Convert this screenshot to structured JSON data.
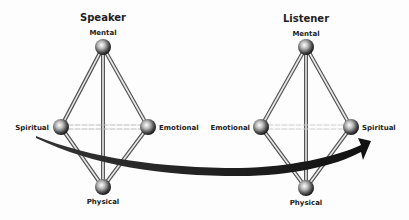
{
  "diagrams": [
    {
      "title": "Speaker",
      "nodes": {
        "top": "Mental",
        "left": "Spiritual",
        "right": "Emotional",
        "bottom": "Physical"
      }
    },
    {
      "title": "Listener",
      "nodes": {
        "top": "Mental",
        "left": "Emotional",
        "right": "Spiritual",
        "bottom": "Physical"
      }
    }
  ],
  "arrow": {
    "from": "Speaker Spiritual",
    "to": "Listener Spiritual",
    "color": "#1e1e1e"
  }
}
